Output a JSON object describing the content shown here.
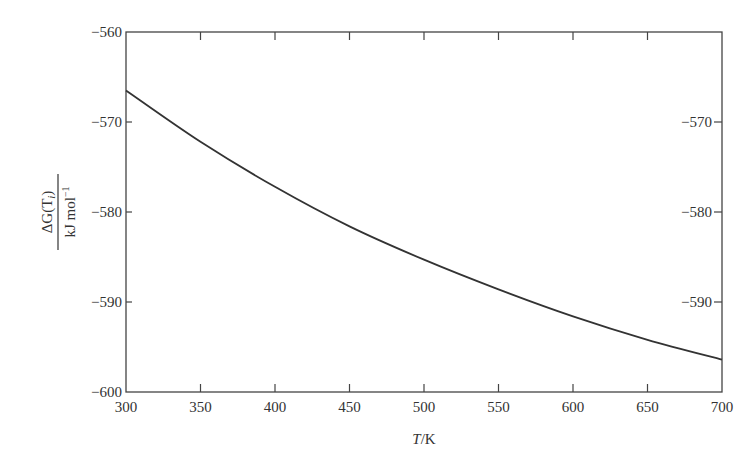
{
  "chart_data": {
    "type": "line",
    "title": "",
    "xlabel": "T/K",
    "ylabel": "ΔG(T_i) / kJ mol^-1",
    "ylabel_numerator": "ΔG(T",
    "ylabel_subscript": "i",
    "ylabel_numerator_close": ")",
    "ylabel_denominator": "kJ mol",
    "ylabel_denominator_sup": "−1",
    "xlim": [
      300,
      700
    ],
    "ylim": [
      -600,
      -560
    ],
    "xticks": [
      300,
      350,
      400,
      450,
      500,
      550,
      600,
      650,
      700
    ],
    "xtick_labels": [
      "300",
      "350",
      "400",
      "450",
      "500",
      "550",
      "600",
      "650",
      "700"
    ],
    "yticks": [
      -600,
      -590,
      -580,
      -570,
      -560
    ],
    "ytick_labels": [
      "−600",
      "−590",
      "−580",
      "−570",
      "−560"
    ],
    "grid": false,
    "legend": null,
    "series": [
      {
        "name": "ΔG(T_i)",
        "color": "#333333",
        "x": [
          300,
          350,
          400,
          450,
          500,
          550,
          600,
          650,
          700
        ],
        "y": [
          -566.5,
          -572.2,
          -577.2,
          -581.6,
          -585.3,
          -588.6,
          -591.6,
          -594.2,
          -596.4
        ]
      }
    ]
  }
}
